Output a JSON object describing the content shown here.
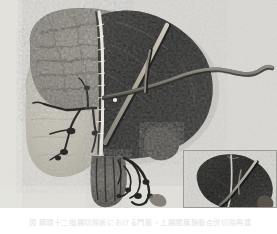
{
  "figure": {
    "kind": "anatomical-specimen-photograph",
    "modality": "grayscale-photograph",
    "caption": "図  膵頭十二指腸切除術における門脈・上腸間膜静脈合併切除再建",
    "colors": {
      "plate_background": "#dcdcd8",
      "specimen_dark": "#1d1d1d",
      "specimen_mid": "#4a4a48",
      "specimen_cut_surface": "#9a968c",
      "specimen_pale_lobe": "#c2beb1",
      "vessel_highlight": "#b9b4a6",
      "catheter": "#6f6c64",
      "inset_border": "#9a9a96",
      "caption_text": "#e2e2e2",
      "page_background": "#ffffff"
    },
    "layout": {
      "plate": {
        "x": 0,
        "y": 0,
        "width": 277,
        "height": 208
      },
      "inset": {
        "x": 183,
        "y": 150,
        "width": 94,
        "height": 58
      },
      "caption_row": {
        "x": 0,
        "y": 208,
        "width": 277,
        "height": 26
      }
    },
    "regions": [
      {
        "name": "cut-surface-left-upper",
        "label": ""
      },
      {
        "name": "pale-lobe-left-lower",
        "label": ""
      },
      {
        "name": "dark-lobe-right",
        "label": ""
      },
      {
        "name": "vascular-tree",
        "label": ""
      },
      {
        "name": "catheter-tube",
        "label": ""
      },
      {
        "name": "marker-dot",
        "label": ""
      },
      {
        "name": "inset-magnified-view",
        "label": ""
      }
    ]
  }
}
